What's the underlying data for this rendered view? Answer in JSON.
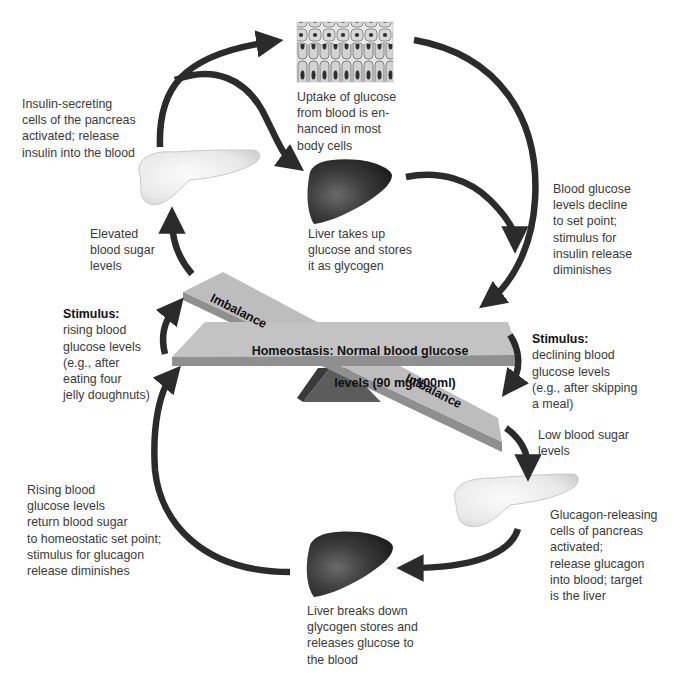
{
  "diagram": {
    "seesaw": {
      "homeostasis_line1": "Homeostasis: Normal blood glucose",
      "homeostasis_line2": "levels (90 mg/100ml)",
      "imbalance_top": "Imbalance",
      "imbalance_bottom": "Imbalance"
    },
    "insulin_pathway": {
      "stimulus_heading": "Stimulus:",
      "stimulus_text": "rising blood\nglucose levels\n(e.g., after\neating four\njelly doughnuts)",
      "elevated": "Elevated\nblood sugar\nlevels",
      "pancreas": "Insulin-secreting\ncells of the pancreas\nactivated; release\ninsulin into the blood",
      "body_cells": "Uptake of glucose\nfrom blood is en-\nhanced in most\nbody cells",
      "liver": "Liver takes up\nglucose and stores\nit as glycogen",
      "return": "Blood glucose\nlevels decline\nto set point;\nstimulus for\ninsulin release\ndiminishes"
    },
    "glucagon_pathway": {
      "stimulus_heading": "Stimulus:",
      "stimulus_text": "declining blood\nglucose levels\n(e.g., after skipping\na meal)",
      "low": "Low blood sugar\nlevels",
      "pancreas": "Glucagon-releasing\ncells of pancreas\nactivated;\nrelease glucagon\ninto blood; target\nis the liver",
      "liver": "Liver breaks down\nglycogen stores and\nreleases glucose to\nthe blood",
      "return": "Rising blood\nglucose levels\nreturn blood sugar\nto homeostatic set point;\nstimulus for glucagon\nrelease diminishes"
    },
    "icons": [
      "epithelial-cells-icon",
      "pancreas-icon",
      "liver-icon",
      "seesaw-icon",
      "arrow-icon"
    ],
    "colors": {
      "arrow": "#2b2b2b",
      "beam": "#b9b9b9",
      "beam_edge": "#8e8e8e",
      "fulcrum": "#5c5c5c",
      "liver": "#3a3a3a",
      "pancreas": "#ececec"
    }
  }
}
